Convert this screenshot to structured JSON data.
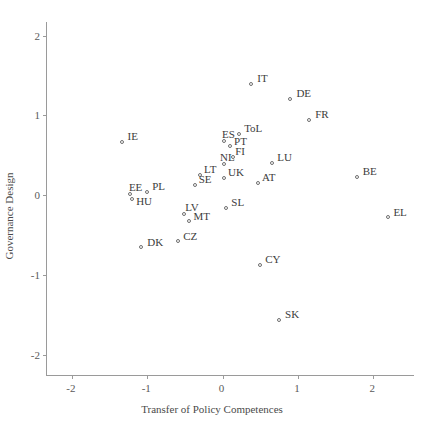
{
  "chart_data": {
    "type": "scatter",
    "title": "",
    "xlabel": "Transfer of Policy Competences",
    "ylabel": "Governance Design",
    "xlim": [
      -2.33,
      2.54
    ],
    "ylim": [
      -2.25,
      2.17
    ],
    "xticks": [
      -2,
      -1,
      0,
      1,
      2
    ],
    "xticklabels": [
      "-2",
      "-1",
      "0",
      "1",
      "2"
    ],
    "yticks": [
      2,
      1,
      0,
      -1,
      -2
    ],
    "yticklabels": [
      "2",
      "1",
      "0",
      "-1",
      "-2"
    ],
    "grid": false,
    "legend": null,
    "marker": "open-circle",
    "marker_color": "#6f6f6f",
    "label_color": "#3c3c3c",
    "axis_color": "#9a9a9a",
    "points": [
      {
        "label": "IT",
        "x": 0.38,
        "y": 1.39,
        "lx": 6,
        "ly": -11
      },
      {
        "label": "DE",
        "x": 0.9,
        "y": 1.21,
        "lx": 6,
        "ly": -11
      },
      {
        "label": "FR",
        "x": 1.15,
        "y": 0.94,
        "lx": 6,
        "ly": -11
      },
      {
        "label": "ToL",
        "x": 0.22,
        "y": 0.77,
        "lx": 5,
        "ly": -11
      },
      {
        "label": "ES",
        "x": 0.02,
        "y": 0.68,
        "lx": -2,
        "ly": -12
      },
      {
        "label": "IE",
        "x": -1.34,
        "y": 0.67,
        "lx": 6,
        "ly": -11
      },
      {
        "label": "PT",
        "x": 0.1,
        "y": 0.62,
        "lx": 4,
        "ly": -10
      },
      {
        "label": "FI",
        "x": 0.14,
        "y": 0.48,
        "lx": 2,
        "ly": -11
      },
      {
        "label": "NL",
        "x": 0.02,
        "y": 0.39,
        "lx": -4,
        "ly": -12
      },
      {
        "label": "LU",
        "x": 0.66,
        "y": 0.41,
        "lx": 5,
        "ly": -11
      },
      {
        "label": "LT",
        "x": -0.3,
        "y": 0.25,
        "lx": 4,
        "ly": -11
      },
      {
        "label": "UK",
        "x": 0.02,
        "y": 0.22,
        "lx": 4,
        "ly": -11
      },
      {
        "label": "BE",
        "x": 1.78,
        "y": 0.23,
        "lx": 6,
        "ly": -11
      },
      {
        "label": "AT",
        "x": 0.47,
        "y": 0.16,
        "lx": 4,
        "ly": -11
      },
      {
        "label": "SE",
        "x": -0.37,
        "y": 0.13,
        "lx": 4,
        "ly": -11
      },
      {
        "label": "PL",
        "x": -1.0,
        "y": 0.04,
        "lx": 5,
        "ly": -11
      },
      {
        "label": "EE",
        "x": -1.23,
        "y": 0.02,
        "lx": -1,
        "ly": -12
      },
      {
        "label": "HU",
        "x": -1.2,
        "y": -0.05,
        "lx": 4,
        "ly": -3
      },
      {
        "label": "SL",
        "x": 0.05,
        "y": -0.16,
        "lx": 5,
        "ly": -11
      },
      {
        "label": "LV",
        "x": -0.51,
        "y": -0.23,
        "lx": 1,
        "ly": -12
      },
      {
        "label": "MT",
        "x": -0.44,
        "y": -0.32,
        "lx": 4,
        "ly": -10
      },
      {
        "label": "EL",
        "x": 2.2,
        "y": -0.27,
        "lx": 5,
        "ly": -10
      },
      {
        "label": "CZ",
        "x": -0.59,
        "y": -0.57,
        "lx": 5,
        "ly": -10
      },
      {
        "label": "DK",
        "x": -1.08,
        "y": -0.65,
        "lx": 6,
        "ly": -10
      },
      {
        "label": "CY",
        "x": 0.5,
        "y": -0.87,
        "lx": 5,
        "ly": -11
      },
      {
        "label": "SK",
        "x": 0.75,
        "y": -1.56,
        "lx": 6,
        "ly": -11
      }
    ]
  }
}
